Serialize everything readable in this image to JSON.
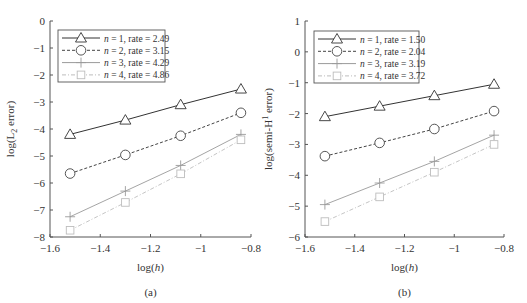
{
  "chart_data": [
    {
      "type": "line",
      "panel_label": "(a)",
      "title": "",
      "xlabel": "log(h)",
      "ylabel": "log(L2 error)",
      "ylabel_parts": {
        "pre": "log(L",
        "sub": "2",
        "post": " error)"
      },
      "xlim": [
        -1.6,
        -0.8
      ],
      "ylim": [
        -8,
        0
      ],
      "x_ticks": [
        -1.6,
        -1.4,
        -1.2,
        -1,
        -0.8
      ],
      "x_tick_labels": [
        "−1.6",
        "−1.4",
        "−1.2",
        "−1",
        "−0.8"
      ],
      "y_ticks": [
        0,
        -1,
        -2,
        -3,
        -4,
        -5,
        -6,
        -7,
        -8
      ],
      "y_tick_labels": [
        "0",
        "−1",
        "−2",
        "−3",
        "−4",
        "−5",
        "−6",
        "−7",
        "−8"
      ],
      "grid": false,
      "legend_position": "upper left",
      "x": [
        -1.52,
        -1.3,
        -1.08,
        -0.84
      ],
      "series": [
        {
          "name": "n = 1, rate = 2.49",
          "n": "1",
          "rate": "2.49",
          "marker": "triangle",
          "line": "solid",
          "color": "#333333",
          "values": [
            -4.2,
            -3.67,
            -3.1,
            -2.52
          ]
        },
        {
          "name": "n = 2, rate = 3.15",
          "n": "2",
          "rate": "3.15",
          "marker": "circle",
          "line": "dashed",
          "color": "#444444",
          "values": [
            -5.65,
            -4.96,
            -4.25,
            -3.4
          ]
        },
        {
          "name": "n = 3, rate = 4.29",
          "n": "3",
          "rate": "4.29",
          "marker": "plus",
          "line": "solid",
          "color": "#9a9a9a",
          "values": [
            -7.25,
            -6.3,
            -5.35,
            -4.2
          ]
        },
        {
          "name": "n = 4, rate = 4.86",
          "n": "4",
          "rate": "4.86",
          "marker": "square",
          "line": "dashdot",
          "color": "#bdbdbd",
          "values": [
            -7.75,
            -6.72,
            -5.66,
            -4.4
          ]
        }
      ]
    },
    {
      "type": "line",
      "panel_label": "(b)",
      "title": "",
      "xlabel": "log(h)",
      "ylabel": "log(semi-H1 error)",
      "ylabel_parts": {
        "pre": "log(semi-H",
        "sup": "1",
        "post": " error)"
      },
      "xlim": [
        -1.6,
        -0.8
      ],
      "ylim": [
        -6,
        1
      ],
      "x_ticks": [
        -1.6,
        -1.4,
        -1.2,
        -1,
        -0.8
      ],
      "x_tick_labels": [
        "−1.6",
        "−1.4",
        "−1.2",
        "−1",
        "−0.8"
      ],
      "y_ticks": [
        1,
        0,
        -1,
        -2,
        -3,
        -4,
        -5,
        -6
      ],
      "y_tick_labels": [
        "1",
        "0",
        "−1",
        "−2",
        "−3",
        "−4",
        "−5",
        "−6"
      ],
      "grid": false,
      "legend_position": "upper left",
      "x": [
        -1.52,
        -1.3,
        -1.08,
        -0.84
      ],
      "series": [
        {
          "name": "n = 1, rate = 1.50",
          "n": "1",
          "rate": "1.50",
          "marker": "triangle",
          "line": "solid",
          "color": "#333333",
          "values": [
            -2.1,
            -1.76,
            -1.42,
            -1.05
          ]
        },
        {
          "name": "n = 2, rate = 2.04",
          "n": "2",
          "rate": "2.04",
          "marker": "circle",
          "line": "dashed",
          "color": "#444444",
          "values": [
            -3.38,
            -2.95,
            -2.5,
            -1.92
          ]
        },
        {
          "name": "n = 3, rate = 3.19",
          "n": "3",
          "rate": "3.19",
          "marker": "plus",
          "line": "solid",
          "color": "#9a9a9a",
          "values": [
            -4.95,
            -4.25,
            -3.55,
            -2.7
          ]
        },
        {
          "name": "n = 4, rate = 3.72",
          "n": "4",
          "rate": "3.72",
          "marker": "square",
          "line": "dashdot",
          "color": "#bdbdbd",
          "values": [
            -5.5,
            -4.7,
            -3.9,
            -3.0
          ]
        }
      ]
    }
  ],
  "layout": {
    "panels": [
      {
        "px_x0": 50,
        "px_x1": 251,
        "px_y0": 21,
        "px_y1": 237,
        "ylabel_x": 14,
        "legend": {
          "x": 58,
          "y": 30,
          "w": 107,
          "h": 52
        }
      },
      {
        "px_x0": 305,
        "px_x1": 504,
        "px_y0": 21,
        "px_y1": 237,
        "ylabel_x": 272,
        "legend": {
          "x": 314,
          "y": 31,
          "w": 105,
          "h": 52
        }
      }
    ]
  }
}
